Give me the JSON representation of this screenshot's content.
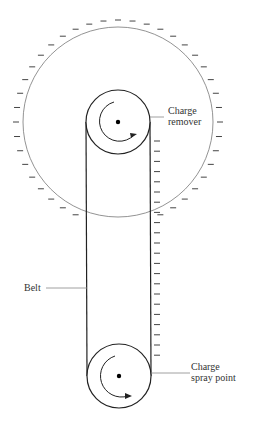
{
  "diagram": {
    "labels": {
      "charge_remover": [
        "Charge",
        "remover"
      ],
      "belt": "Belt",
      "charge_spray": [
        "Charge",
        "spray point"
      ]
    },
    "sphere_charge": "negative",
    "belt_charge": "negative"
  }
}
